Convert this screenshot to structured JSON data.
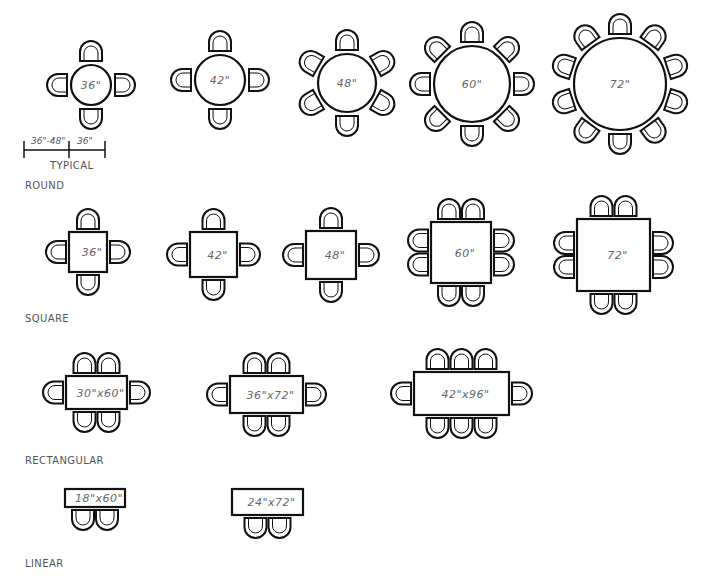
{
  "diagram": {
    "line_color": "#111111",
    "label_color": "#666666"
  },
  "categories": {
    "round": {
      "label": "ROUND",
      "x": 25,
      "y": 180
    },
    "square": {
      "label": "SQUARE",
      "x": 25,
      "y": 313
    },
    "rectangular": {
      "label": "RECTANGULAR",
      "x": 25,
      "y": 455
    },
    "linear": {
      "label": "LINEAR",
      "x": 25,
      "y": 558
    }
  },
  "dimension": {
    "clearance_label": "36\"-48\"",
    "chair_zone_label": "36\"",
    "note": "TYPICAL"
  },
  "tables": [
    {
      "id": "round-36",
      "shape": "round",
      "label": "36\"",
      "cx": 91,
      "cy": 85,
      "r": 20,
      "seats": 4,
      "chair_offset": 34,
      "start_angle": -90
    },
    {
      "id": "round-42",
      "shape": "round",
      "label": "42\"",
      "cx": 220,
      "cy": 80,
      "r": 25,
      "seats": 4,
      "chair_offset": 38,
      "start_angle": -90
    },
    {
      "id": "round-48",
      "shape": "round",
      "label": "48\"",
      "cx": 347,
      "cy": 83,
      "r": 29,
      "seats": 6,
      "chair_offset": 42,
      "start_angle": -90
    },
    {
      "id": "round-60",
      "shape": "round",
      "label": "60\"",
      "cx": 472,
      "cy": 84,
      "r": 38,
      "seats": 8,
      "chair_offset": 50,
      "start_angle": -90
    },
    {
      "id": "round-72",
      "shape": "round",
      "label": "72\"",
      "cx": 620,
      "cy": 84,
      "r": 46,
      "seats": 10,
      "chair_offset": 58,
      "start_angle": -90
    },
    {
      "id": "square-36",
      "shape": "rect",
      "label": "36\"",
      "x": 69,
      "y": 232,
      "w": 38,
      "h": 40,
      "chairs": {
        "top": 1,
        "bottom": 1,
        "left": 1,
        "right": 1
      }
    },
    {
      "id": "square-42",
      "shape": "rect",
      "label": "42\"",
      "x": 190,
      "y": 232,
      "w": 47,
      "h": 45,
      "chairs": {
        "top": 1,
        "bottom": 1,
        "left": 1,
        "right": 1
      }
    },
    {
      "id": "square-48",
      "shape": "rect",
      "label": "48\"",
      "x": 306,
      "y": 231,
      "w": 50,
      "h": 48,
      "chairs": {
        "top": 1,
        "bottom": 1,
        "left": 1,
        "right": 1
      }
    },
    {
      "id": "square-60",
      "shape": "rect",
      "label": "60\"",
      "x": 431,
      "y": 222,
      "w": 60,
      "h": 61,
      "chairs": {
        "top": 2,
        "bottom": 2,
        "left": 2,
        "right": 2
      }
    },
    {
      "id": "square-72",
      "shape": "rect",
      "label": "72\"",
      "x": 577,
      "y": 219,
      "w": 73,
      "h": 72,
      "chairs": {
        "top": 2,
        "bottom": 2,
        "left": 2,
        "right": 2
      }
    },
    {
      "id": "rect-30x60",
      "shape": "rect",
      "label": "30\"x60\"",
      "x": 66,
      "y": 376,
      "w": 61,
      "h": 33,
      "chairs": {
        "top": 2,
        "bottom": 2,
        "left": 1,
        "right": 1
      }
    },
    {
      "id": "rect-36x72",
      "shape": "rect",
      "label": "36\"x72\"",
      "x": 230,
      "y": 376,
      "w": 73,
      "h": 37,
      "chairs": {
        "top": 2,
        "bottom": 2,
        "left": 1,
        "right": 1
      }
    },
    {
      "id": "rect-42x96",
      "shape": "rect",
      "label": "42\"x96\"",
      "x": 414,
      "y": 372,
      "w": 95,
      "h": 43,
      "chairs": {
        "top": 3,
        "bottom": 3,
        "left": 1,
        "right": 1
      }
    },
    {
      "id": "linear-18x60",
      "shape": "rect",
      "label": "18\"x60\"",
      "x": 65,
      "y": 489,
      "w": 60,
      "h": 18,
      "chairs": {
        "top": 0,
        "bottom": 2,
        "left": 0,
        "right": 0
      }
    },
    {
      "id": "linear-24x72",
      "shape": "rect",
      "label": "24\"x72\"",
      "x": 232,
      "y": 489,
      "w": 71,
      "h": 26,
      "chairs": {
        "top": 0,
        "bottom": 2,
        "left": 0,
        "right": 0
      }
    }
  ]
}
